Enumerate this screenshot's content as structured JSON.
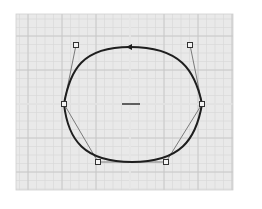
{
  "canvas": {
    "width": 262,
    "height": 209,
    "background": "#ffffff"
  },
  "grid": {
    "x0": 16,
    "y0": 14,
    "x1": 233,
    "y1": 190,
    "minor_step": 8.5,
    "major_step": 34,
    "background": "#e9e9e9",
    "minor_color": "#d6d6d6",
    "major_color": "#c4c4c4",
    "axis_color": "#f7f7f7",
    "origin": {
      "x": 130,
      "y": 104
    }
  },
  "curve": {
    "color": "#1e1e1e",
    "stroke_width": 2,
    "path": "M130,47 C180,47 195,70 202,104 C196,140 180,162 132,162 C84,162 68,140 64,104 C70,70 82,47 130,47 Z",
    "direction_arrow": {
      "x": 130,
      "y": 47,
      "points_left": true
    }
  },
  "control_lines": {
    "color": "#7a7a7a",
    "polyline": [
      [
        76,
        45
      ],
      [
        64,
        104
      ],
      [
        98,
        162
      ],
      [
        166,
        162
      ],
      [
        202,
        104
      ],
      [
        190,
        45
      ]
    ]
  },
  "control_points": [
    {
      "name": "top-left-handle",
      "x": 76,
      "y": 45
    },
    {
      "name": "left-anchor",
      "x": 64,
      "y": 104
    },
    {
      "name": "bottom-left-handle",
      "x": 98,
      "y": 162
    },
    {
      "name": "bottom-right-handle",
      "x": 166,
      "y": 162
    },
    {
      "name": "right-anchor",
      "x": 202,
      "y": 104
    },
    {
      "name": "top-right-handle",
      "x": 190,
      "y": 45
    }
  ],
  "center_marker": {
    "x1": 122,
    "x2": 140,
    "y": 104,
    "color": "#333333"
  }
}
